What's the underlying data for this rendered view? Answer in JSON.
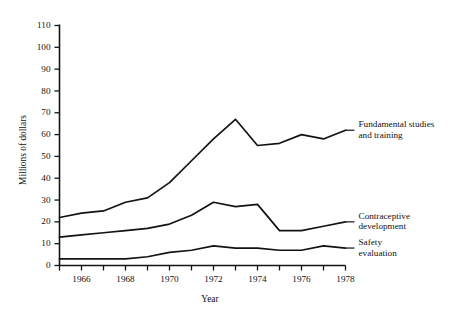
{
  "chart_data": {
    "type": "line",
    "title": "",
    "xlabel": "Year",
    "ylabel": "Millions of dollars",
    "x": [
      1965,
      1966,
      1967,
      1968,
      1969,
      1970,
      1971,
      1972,
      1973,
      1974,
      1975,
      1976,
      1977,
      1978
    ],
    "xlim": [
      1965,
      1978
    ],
    "ylim": [
      0,
      110
    ],
    "x_tick_values": [
      1965,
      1966,
      1967,
      1968,
      1969,
      1970,
      1971,
      1972,
      1973,
      1974,
      1975,
      1976,
      1977,
      1978
    ],
    "x_tick_labels": [
      "",
      "1966",
      "",
      "1968",
      "",
      "1970",
      "",
      "1972",
      "",
      "1974",
      "",
      "1976",
      "",
      "1978"
    ],
    "y_ticks": [
      0,
      10,
      20,
      30,
      40,
      50,
      60,
      70,
      80,
      90,
      100,
      110
    ],
    "grid": false,
    "legend_position": "inline-right",
    "series": [
      {
        "name": "Fundamental studies and training",
        "label_lines": [
          "Fundamental studies",
          "and training"
        ],
        "values": [
          22,
          24,
          25,
          29,
          31,
          38,
          48,
          58,
          67,
          55,
          56,
          60,
          58,
          62
        ]
      },
      {
        "name": "Contraceptive development",
        "label_lines": [
          "Contraceptive",
          "development"
        ],
        "values": [
          13,
          14,
          15,
          16,
          17,
          19,
          23,
          29,
          27,
          28,
          16,
          16,
          18,
          20
        ]
      },
      {
        "name": "Safety evaluation",
        "label_lines": [
          "Safety",
          "evaluation"
        ],
        "values": [
          3,
          3,
          3,
          3,
          4,
          6,
          7,
          9,
          8,
          8,
          7,
          7,
          9,
          8
        ]
      }
    ]
  },
  "colors": {
    "ink": "#131313",
    "background": "#ffffff"
  }
}
